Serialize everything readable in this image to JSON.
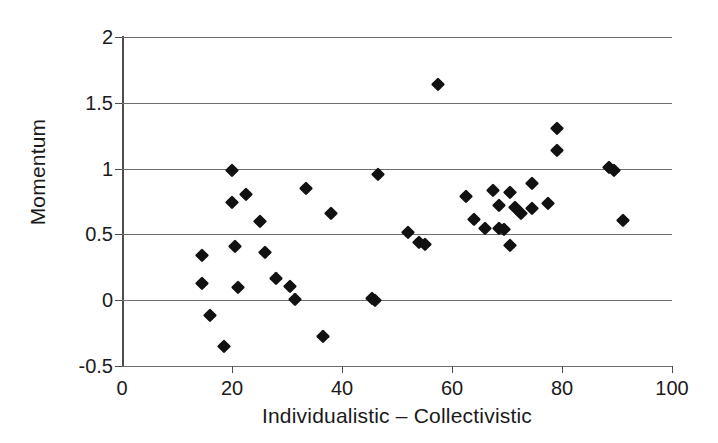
{
  "chart_data": {
    "type": "scatter",
    "title": "",
    "xlabel": "Individualistic – Collectivistic",
    "ylabel": "Momentum",
    "xlim": [
      0,
      100
    ],
    "ylim": [
      -0.5,
      2
    ],
    "xticks": [
      0,
      20,
      40,
      60,
      80,
      100
    ],
    "yticks": [
      -0.5,
      0,
      0.5,
      1,
      1.5,
      2
    ],
    "xtick_labels": [
      "0",
      "20",
      "40",
      "60",
      "80",
      "100"
    ],
    "ytick_labels": [
      "-0.5",
      "0",
      "0.5",
      "1",
      "1.5",
      "2"
    ],
    "grid": "horizontal",
    "legend": "none",
    "marker": "filled-diamond",
    "marker_color": "#111111",
    "grid_color": "#6e6e6e",
    "axis_color": "#4d4d4d",
    "background": "#ffffff",
    "n_points": 40,
    "points": [
      {
        "x": 14.5,
        "y": 0.34
      },
      {
        "x": 14.5,
        "y": 0.13
      },
      {
        "x": 16.0,
        "y": -0.11
      },
      {
        "x": 18.5,
        "y": -0.35
      },
      {
        "x": 20.0,
        "y": 0.99
      },
      {
        "x": 20.0,
        "y": 0.75
      },
      {
        "x": 20.5,
        "y": 0.41
      },
      {
        "x": 21.0,
        "y": 0.1
      },
      {
        "x": 22.5,
        "y": 0.81
      },
      {
        "x": 25.0,
        "y": 0.6
      },
      {
        "x": 26.0,
        "y": 0.37
      },
      {
        "x": 28.0,
        "y": 0.17
      },
      {
        "x": 30.5,
        "y": 0.11
      },
      {
        "x": 31.5,
        "y": 0.01
      },
      {
        "x": 33.5,
        "y": 0.85
      },
      {
        "x": 36.5,
        "y": -0.27
      },
      {
        "x": 38.0,
        "y": 0.66
      },
      {
        "x": 45.5,
        "y": 0.02
      },
      {
        "x": 46.0,
        "y": 0.0
      },
      {
        "x": 46.5,
        "y": 0.96
      },
      {
        "x": 52.0,
        "y": 0.52
      },
      {
        "x": 54.0,
        "y": 0.44
      },
      {
        "x": 55.0,
        "y": 0.43
      },
      {
        "x": 57.5,
        "y": 1.64
      },
      {
        "x": 62.5,
        "y": 0.79
      },
      {
        "x": 64.0,
        "y": 0.62
      },
      {
        "x": 66.0,
        "y": 0.55
      },
      {
        "x": 67.5,
        "y": 0.84
      },
      {
        "x": 68.5,
        "y": 0.72
      },
      {
        "x": 68.5,
        "y": 0.55
      },
      {
        "x": 69.5,
        "y": 0.54
      },
      {
        "x": 70.5,
        "y": 0.82
      },
      {
        "x": 70.5,
        "y": 0.42
      },
      {
        "x": 71.5,
        "y": 0.71
      },
      {
        "x": 72.5,
        "y": 0.66
      },
      {
        "x": 74.5,
        "y": 0.89
      },
      {
        "x": 74.5,
        "y": 0.7
      },
      {
        "x": 77.5,
        "y": 0.74
      },
      {
        "x": 79.0,
        "y": 1.31
      },
      {
        "x": 79.0,
        "y": 1.14
      },
      {
        "x": 88.5,
        "y": 1.01
      },
      {
        "x": 89.5,
        "y": 0.99
      },
      {
        "x": 91.0,
        "y": 0.61
      }
    ]
  }
}
